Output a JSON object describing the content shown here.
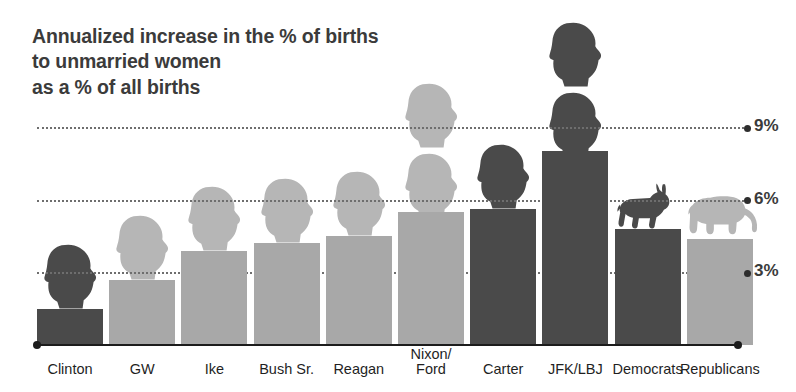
{
  "title": "Annualized increase in the % of births\nto unmarried women\nas a % of all births",
  "colors": {
    "democrat_bar": "#4a4a4a",
    "republican_bar": "#a8a8a8",
    "democrat_silhouette": "#4a4a4a",
    "republican_silhouette": "#b6b6b6",
    "axis": "#1c1c1c",
    "gridline": "#6e6e6e",
    "title_text": "#3b3b3b",
    "label_text": "#1f1f1f"
  },
  "axis": {
    "gridlines": [
      {
        "label": "9%",
        "value": 9
      },
      {
        "label": "6%",
        "value": 6
      },
      {
        "label": "3%",
        "value": 3
      }
    ]
  },
  "chart_data": {
    "type": "bar",
    "title": "Annualized increase in the % of births to unmarried women as a % of all births",
    "xlabel": "",
    "ylabel": "",
    "ylim": [
      0,
      9.8
    ],
    "grid": true,
    "legend": "none",
    "gridline_values": [
      3,
      6,
      9
    ],
    "gridline_labels": [
      "3%",
      "6%",
      "9%"
    ],
    "categories": [
      "Clinton",
      "GW",
      "Ike",
      "Bush Sr.",
      "Reagan",
      "Nixon/\nFord",
      "Carter",
      "JFK/LBJ",
      "Democrats",
      "Republicans"
    ],
    "values": [
      1.5,
      2.7,
      3.9,
      4.2,
      4.5,
      5.5,
      5.6,
      8.0,
      4.8,
      4.4
    ],
    "party": [
      "democrat",
      "republican",
      "republican",
      "republican",
      "republican",
      "republican",
      "democrat",
      "democrat",
      "democrat",
      "republican"
    ],
    "icons": [
      "head",
      "head",
      "head",
      "head",
      "head",
      "head-double",
      "head",
      "head-double",
      "donkey",
      "elephant"
    ]
  },
  "bars": [
    {
      "id": "clinton",
      "label": "Clinton",
      "value": 1.5,
      "party": "democrat",
      "icon": "president-head-icon"
    },
    {
      "id": "gw",
      "label": "GW",
      "value": 2.7,
      "party": "republican",
      "icon": "president-head-icon"
    },
    {
      "id": "ike",
      "label": "Ike",
      "value": 3.9,
      "party": "republican",
      "icon": "president-head-icon"
    },
    {
      "id": "bush-sr",
      "label": "Bush Sr.",
      "value": 4.2,
      "party": "republican",
      "icon": "president-head-icon"
    },
    {
      "id": "reagan",
      "label": "Reagan",
      "value": 4.5,
      "party": "republican",
      "icon": "president-head-icon"
    },
    {
      "id": "nixon-ford",
      "label": "Nixon/\nFord",
      "value": 5.5,
      "party": "republican",
      "icon": "president-head-double-icon"
    },
    {
      "id": "carter",
      "label": "Carter",
      "value": 5.6,
      "party": "democrat",
      "icon": "president-head-icon"
    },
    {
      "id": "jfk-lbj",
      "label": "JFK/LBJ",
      "value": 8.0,
      "party": "democrat",
      "icon": "president-head-double-icon"
    },
    {
      "id": "democrats",
      "label": "Democrats",
      "value": 4.8,
      "party": "democrat",
      "icon": "donkey-icon"
    },
    {
      "id": "republicans",
      "label": "Republicans",
      "value": 4.4,
      "party": "republican",
      "icon": "elephant-icon"
    }
  ]
}
